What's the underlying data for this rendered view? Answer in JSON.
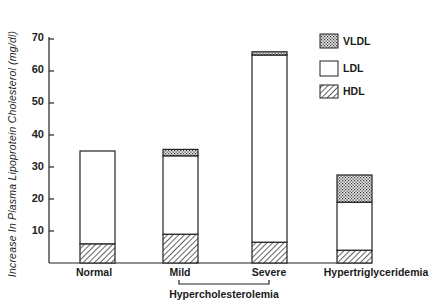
{
  "chart_data": {
    "type": "bar",
    "stacked": true,
    "title": "",
    "xlabel": "",
    "ylabel": "Increase In Plasma Lipoprotein Cholesterol (mg/dl)",
    "ylim": [
      0,
      70
    ],
    "yticks": [
      10,
      20,
      30,
      40,
      50,
      60,
      70
    ],
    "categories": [
      "Normal",
      "Mild",
      "Severe",
      "Hypertriglyceridemia"
    ],
    "group_label": {
      "text": "Hypercholesterolemia",
      "spans": [
        "Mild",
        "Severe"
      ]
    },
    "series": [
      {
        "name": "HDL",
        "pattern": "diagonal-hatch",
        "values": [
          6,
          9,
          6.5,
          4
        ]
      },
      {
        "name": "LDL",
        "pattern": "open",
        "values": [
          29,
          24.5,
          58.5,
          15
        ]
      },
      {
        "name": "VLDL",
        "pattern": "crosshatch-dots",
        "values": [
          0,
          2,
          1,
          8.5
        ]
      }
    ],
    "totals": [
      35,
      35.5,
      66,
      27.5
    ],
    "legend": {
      "position": "upper-right",
      "entries": [
        "VLDL",
        "LDL",
        "HDL"
      ]
    },
    "grid": false
  },
  "axis": {
    "ylabel": "Increase In Plasma Lipoprotein Cholesterol (mg/dl)",
    "ticks": [
      "10",
      "20",
      "30",
      "40",
      "50",
      "60",
      "70"
    ]
  },
  "categories": [
    "Normal",
    "Mild",
    "Severe",
    "Hypertriglyceridemia"
  ],
  "group_label": "Hypercholesterolemia",
  "legend": [
    "VLDL",
    "LDL",
    "HDL"
  ]
}
